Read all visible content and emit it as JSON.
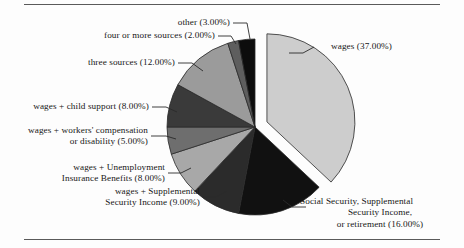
{
  "figure": {
    "background_color": "#fdfdfd",
    "rule_color": "#5a5a5a",
    "text_color": "#171717"
  },
  "chart_data": {
    "type": "pie",
    "title": "",
    "subtitle": "",
    "xlabel": "",
    "ylabel": "",
    "legend_position": "none",
    "grid": false,
    "value_unit": "percent",
    "value_format": "0.00%",
    "exploded_slice": "wages",
    "start_angle_deg": 90,
    "direction": "clockwise",
    "categories": [
      "wages",
      "Social Security, Supplemental Security Income, or retirement",
      "wages + Supplemental Security Income",
      "wages + Unemployment Insurance Benefits",
      "wages + workers' compensation or disability",
      "wages + child support",
      "three sources",
      "four or more sources",
      "other"
    ],
    "values": [
      37.0,
      16.0,
      9.0,
      8.0,
      5.0,
      8.0,
      12.0,
      2.0,
      3.0
    ],
    "slices": [
      {
        "name": "wages",
        "label": "wages (37.00%)",
        "value": 37.0,
        "color": "#cdcdcd",
        "exploded": true
      },
      {
        "name": "social-security-ssi-retirement",
        "label_line_1": "Social Security, Supplemental",
        "label_line_2": "Security Income,",
        "label_line_3": "or retirement (16.00%)",
        "value": 16.0,
        "color": "#111111",
        "exploded": false
      },
      {
        "name": "wages-plus-ssi",
        "label_line_1": "wages + Supplemental",
        "label_line_2": "Security Income (9.00%)",
        "value": 9.0,
        "color": "#2b2b2b",
        "exploded": false
      },
      {
        "name": "wages-plus-unemployment",
        "label_line_1": "wages + Unemployment",
        "label_line_2": "Insurance Benefits (8.00%)",
        "value": 8.0,
        "color": "#a8a8a8",
        "exploded": false
      },
      {
        "name": "wages-plus-workers-comp",
        "label_line_1": "wages + workers' compensation",
        "label_line_2": "or disability (5.00%)",
        "value": 5.0,
        "color": "#6e6e6e",
        "exploded": false
      },
      {
        "name": "wages-plus-child-support",
        "label": "wages + child support (8.00%)",
        "value": 8.0,
        "color": "#3a3a3a",
        "exploded": false
      },
      {
        "name": "three-sources",
        "label": "three sources (12.00%)",
        "value": 12.0,
        "color": "#9b9b9b",
        "exploded": false
      },
      {
        "name": "four-or-more-sources",
        "label": "four or more sources (2.00%)",
        "value": 2.0,
        "color": "#5e5e5e",
        "exploded": false
      },
      {
        "name": "other",
        "label": "other (3.00%)",
        "value": 3.0,
        "color": "#0d0d0d",
        "exploded": false
      }
    ]
  }
}
